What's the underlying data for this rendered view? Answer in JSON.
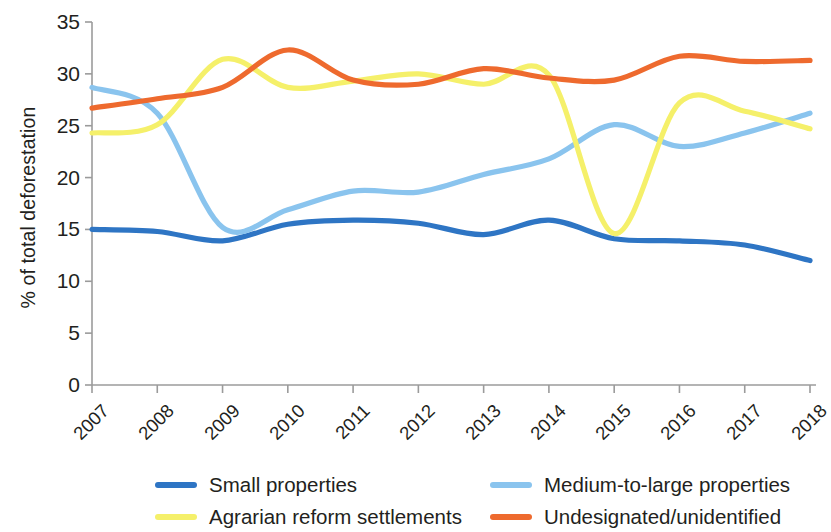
{
  "chart_data": {
    "type": "line",
    "title": "",
    "subtitle": "",
    "xlabel": "",
    "ylabel": "% of total deforestation",
    "categories": [
      "2007",
      "2008",
      "2009",
      "2010",
      "2011",
      "2012",
      "2013",
      "2014",
      "2015",
      "2016",
      "2017",
      "2018"
    ],
    "x": [
      2007,
      2008,
      2009,
      2010,
      2011,
      2012,
      2013,
      2014,
      2015,
      2016,
      2017,
      2018
    ],
    "xlim": [
      2007,
      2018
    ],
    "ylim": [
      0,
      35
    ],
    "yticks": [
      0,
      5,
      10,
      15,
      20,
      25,
      30,
      35
    ],
    "grid": false,
    "legend_position": "bottom",
    "series": [
      {
        "name": "Small properties",
        "color": "#2e75c4",
        "values": [
          15.0,
          14.8,
          13.9,
          15.5,
          15.9,
          15.6,
          14.5,
          15.9,
          14.1,
          13.9,
          13.5,
          12.0
        ]
      },
      {
        "name": "Medium-to-large properties",
        "color": "#8ac4ee",
        "values": [
          28.7,
          26.2,
          15.2,
          16.9,
          18.7,
          18.6,
          20.3,
          21.8,
          25.1,
          23.0,
          24.3,
          26.2
        ]
      },
      {
        "name": "Agrarian reform settlements",
        "color": "#f5f06a",
        "values": [
          24.3,
          25.1,
          31.4,
          28.7,
          29.3,
          30.0,
          29.0,
          29.9,
          14.6,
          27.2,
          26.4,
          24.7
        ]
      },
      {
        "name": "Undesignated/unidentified",
        "color": "#ee6a2e",
        "values": [
          26.7,
          27.6,
          28.7,
          32.3,
          29.4,
          29.0,
          30.5,
          29.6,
          29.4,
          31.7,
          31.2,
          31.3
        ]
      }
    ]
  },
  "axis": {
    "ytick_labels": [
      "35",
      "30",
      "25",
      "20",
      "15",
      "10",
      "5",
      "0"
    ],
    "xtick_labels": [
      "2007",
      "2008",
      "2009",
      "2010",
      "2011",
      "2012",
      "2013",
      "2014",
      "2015",
      "2016",
      "2017",
      "2018"
    ],
    "ylabel_text": "% of total deforestation"
  },
  "legend": {
    "items": [
      {
        "label": "Small properties",
        "color": "#2e75c4"
      },
      {
        "label": "Medium-to-large properties",
        "color": "#8ac4ee"
      },
      {
        "label": "Agrarian reform settlements",
        "color": "#f5f06a"
      },
      {
        "label": "Undesignated/unidentified",
        "color": "#ee6a2e"
      }
    ]
  }
}
